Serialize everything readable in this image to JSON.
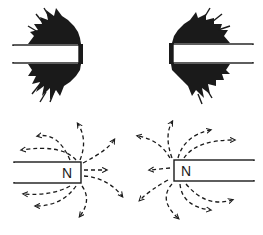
{
  "diagram": {
    "type": "magnetic-field-illustration",
    "panels": [
      {
        "id": "iron-filings-left",
        "description": "Iron filings clustered at right end of bar magnet"
      },
      {
        "id": "iron-filings-right",
        "description": "Iron filings clustered at left end of bar magnet"
      },
      {
        "id": "field-lines-left",
        "pole_label": "N",
        "description": "Dashed field lines radiating from north pole (right end)"
      },
      {
        "id": "field-lines-right",
        "pole_label": "N",
        "description": "Dashed field lines radiating from north pole (left end)"
      }
    ],
    "colors": {
      "ink": "#1a1a1a",
      "background": "#ffffff"
    }
  }
}
